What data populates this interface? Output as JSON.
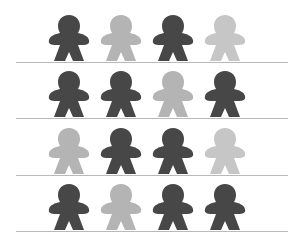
{
  "colors": {
    "dark": "#474747",
    "medium": "#555555",
    "light": "#b4b4b4",
    "lighter": "#c6c6c6",
    "shelf": "#b9b9b9"
  },
  "rows": [
    {
      "figures": [
        "dark",
        "light",
        "dark",
        "lighter"
      ]
    },
    {
      "figures": [
        "dark",
        "dark",
        "light",
        "dark"
      ]
    },
    {
      "figures": [
        "light",
        "dark",
        "dark",
        "lighter"
      ]
    },
    {
      "figures": [
        "dark",
        "light",
        "dark",
        "dark"
      ]
    }
  ]
}
